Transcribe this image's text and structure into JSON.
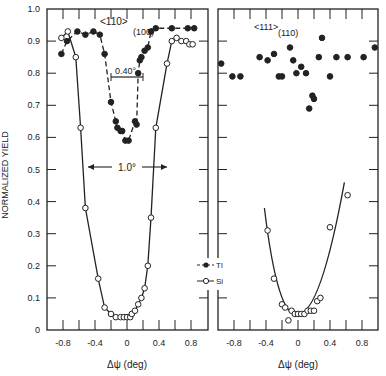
{
  "chart_data": [
    {
      "type": "scatter",
      "panel": "left",
      "annotations": [
        "<110>",
        "(100)",
        "0.40°",
        "1.0°"
      ],
      "xlabel": "Δψ (deg)",
      "ylabel": "NORMALIZED YIELD",
      "xlim": [
        -1.0,
        1.0
      ],
      "ylim": [
        0,
        1.0
      ],
      "xticks": [
        -0.8,
        -0.4,
        0,
        0.4,
        0.8
      ],
      "yticks": [
        0,
        0.1,
        0.2,
        0.3,
        0.4,
        0.5,
        0.6,
        0.7,
        0.8,
        0.9,
        1.0
      ],
      "series": [
        {
          "name": "Tl",
          "marker": "filled-circle",
          "line": "dashed",
          "x": [
            -0.82,
            -0.75,
            -0.62,
            -0.52,
            -0.42,
            -0.34,
            -0.28,
            -0.2,
            -0.14,
            -0.12,
            -0.08,
            -0.06,
            -0.02,
            0.02,
            0.1,
            0.12,
            0.14,
            0.16,
            0.18,
            0.22,
            0.26,
            0.3,
            0.36,
            0.56,
            0.76,
            0.84
          ],
          "y": [
            0.86,
            0.9,
            0.93,
            0.92,
            0.93,
            0.92,
            0.86,
            0.71,
            0.65,
            0.63,
            0.62,
            0.62,
            0.59,
            0.59,
            0.65,
            0.64,
            0.8,
            0.84,
            0.85,
            0.87,
            0.88,
            0.93,
            0.94,
            0.94,
            0.94,
            0.94
          ]
        },
        {
          "name": "Si",
          "marker": "open-circle",
          "line": "solid",
          "x": [
            -0.82,
            -0.74,
            -0.64,
            -0.58,
            -0.52,
            -0.36,
            -0.28,
            -0.2,
            -0.14,
            -0.08,
            -0.04,
            0,
            0.04,
            0.06,
            0.1,
            0.14,
            0.18,
            0.22,
            0.26,
            0.3,
            0.36,
            0.5,
            0.56,
            0.62,
            0.68,
            0.74,
            0.78,
            0.82
          ],
          "y": [
            0.91,
            0.93,
            0.85,
            0.63,
            0.38,
            0.16,
            0.07,
            0.05,
            0.04,
            0.04,
            0.04,
            0.04,
            0.04,
            0.05,
            0.06,
            0.08,
            0.1,
            0.13,
            0.2,
            0.35,
            0.63,
            0.83,
            0.9,
            0.91,
            0.9,
            0.9,
            0.89,
            0.89
          ]
        }
      ]
    },
    {
      "type": "scatter",
      "panel": "right",
      "annotations": [
        "<111>",
        "(110)"
      ],
      "xlabel": "Δψ (deg)",
      "xlim": [
        -1.0,
        1.0
      ],
      "ylim": [
        0,
        1.0
      ],
      "xticks": [
        -0.8,
        -0.4,
        0,
        0.4,
        0.8
      ],
      "series": [
        {
          "name": "Tl",
          "marker": "filled-circle",
          "line": "none",
          "x": [
            -0.96,
            -0.82,
            -0.72,
            -0.48,
            -0.38,
            -0.3,
            -0.24,
            -0.2,
            -0.1,
            -0.06,
            -0.02,
            0.04,
            0.1,
            0.14,
            0.18,
            0.2,
            0.26,
            0.3,
            0.4,
            0.48,
            0.62,
            0.82,
            0.96
          ],
          "y": [
            0.83,
            0.79,
            0.79,
            0.85,
            0.84,
            0.86,
            0.79,
            0.79,
            0.88,
            0.84,
            0.8,
            0.82,
            0.8,
            0.69,
            0.73,
            0.72,
            0.85,
            0.91,
            0.79,
            0.85,
            0.85,
            0.85,
            0.88
          ]
        },
        {
          "name": "Si",
          "marker": "open-circle",
          "line": "solid",
          "x": [
            -0.38,
            -0.3,
            -0.2,
            -0.16,
            -0.12,
            -0.08,
            -0.04,
            0,
            0.04,
            0.08,
            0.12,
            0.16,
            0.2,
            0.24,
            0.28,
            0.4,
            0.62
          ],
          "y": [
            0.31,
            0.16,
            0.08,
            0.07,
            0.03,
            0.06,
            0.05,
            0.05,
            0.05,
            0.05,
            0.06,
            0.06,
            0.06,
            0.09,
            0.1,
            0.32,
            0.42
          ]
        }
      ]
    }
  ],
  "legend": {
    "items": [
      {
        "label": "Tl",
        "marker": "filled-circle"
      },
      {
        "label": "Si",
        "marker": "open-circle"
      }
    ]
  },
  "labels": {
    "ylabel": "NORMALIZED YIELD",
    "xlabel_left": "Δψ (deg)",
    "xlabel_right": "Δψ (deg)",
    "left_axis_label": "<110>",
    "left_axis_sub": "(100)",
    "right_axis_label": "<111>",
    "right_axis_sub": "(110)",
    "width_narrow": "0.40°",
    "width_wide": "1.0°"
  }
}
